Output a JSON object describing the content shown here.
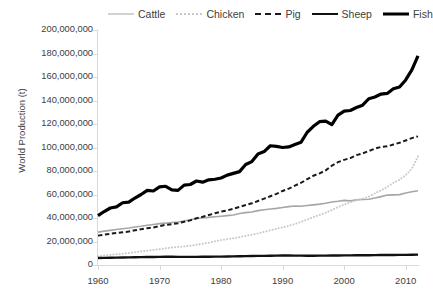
{
  "chart_data": {
    "type": "line",
    "title": "",
    "xlabel": "",
    "ylabel": "World Production (t)",
    "xlim": [
      1960,
      2012
    ],
    "ylim": [
      0,
      200000000
    ],
    "grid": false,
    "legend_position": "top",
    "xticks": [
      "1960",
      "1970",
      "1980",
      "1990",
      "2000",
      "2010"
    ],
    "xtick_values": [
      1960,
      1970,
      1980,
      1990,
      2000,
      2010
    ],
    "yticks": [
      "0",
      "20,000,000",
      "40,000,000",
      "60,000,000",
      "80,000,000",
      "100,000,000",
      "120,000,000",
      "140,000,000",
      "160,000,000",
      "180,000,000",
      "200,000,000"
    ],
    "ytick_values": [
      0,
      20000000,
      40000000,
      60000000,
      80000000,
      100000000,
      120000000,
      140000000,
      160000000,
      180000000,
      200000000
    ],
    "x": [
      1960,
      1961,
      1962,
      1963,
      1964,
      1965,
      1966,
      1967,
      1968,
      1969,
      1970,
      1971,
      1972,
      1973,
      1974,
      1975,
      1976,
      1977,
      1978,
      1979,
      1980,
      1981,
      1982,
      1983,
      1984,
      1985,
      1986,
      1987,
      1988,
      1989,
      1990,
      1991,
      1992,
      1993,
      1994,
      1995,
      1996,
      1997,
      1998,
      1999,
      2000,
      2001,
      2002,
      2003,
      2004,
      2005,
      2006,
      2007,
      2008,
      2009,
      2010,
      2011,
      2012
    ],
    "series": [
      {
        "name": "Cattle",
        "style": "solid",
        "color": "#a6a6a6",
        "width": 1.6,
        "values": [
          28000000,
          28800000,
          29500000,
          30200000,
          30800000,
          31500000,
          32400000,
          33000000,
          33800000,
          34500000,
          35200000,
          35600000,
          36200000,
          36600000,
          37400000,
          38500000,
          39600000,
          40000000,
          40500000,
          41000000,
          41500000,
          42000000,
          42600000,
          43800000,
          44600000,
          45100000,
          46300000,
          47000000,
          47600000,
          48200000,
          49000000,
          49700000,
          50200000,
          50000000,
          50600000,
          51200000,
          51800000,
          52600000,
          53600000,
          54200000,
          55000000,
          54600000,
          55400000,
          55700000,
          56000000,
          57000000,
          58200000,
          59500000,
          59700000,
          59900000,
          61200000,
          62300000,
          63200000
        ]
      },
      {
        "name": "Chicken",
        "style": "dotted",
        "color": "#c9c9c9",
        "width": 2,
        "values": [
          7500000,
          8000000,
          8600000,
          9100000,
          9600000,
          10200000,
          10900000,
          11600000,
          12200000,
          12800000,
          13500000,
          14200000,
          14900000,
          15300000,
          15800000,
          16400000,
          17200000,
          18100000,
          19000000,
          20100000,
          21200000,
          22000000,
          22800000,
          23700000,
          24800000,
          25800000,
          26900000,
          28200000,
          29500000,
          30800000,
          32000000,
          33300000,
          34900000,
          36700000,
          38700000,
          40800000,
          42600000,
          44500000,
          46800000,
          49200000,
          51500000,
          53300000,
          55300000,
          56500000,
          58200000,
          61000000,
          63500000,
          66500000,
          70000000,
          72500000,
          76500000,
          82000000,
          92500000
        ]
      },
      {
        "name": "Pig",
        "style": "dashed",
        "color": "#1a1a1a",
        "width": 2,
        "values": [
          25000000,
          25800000,
          26600000,
          27200000,
          27800000,
          28500000,
          29500000,
          30500000,
          31300000,
          32000000,
          33000000,
          34200000,
          34800000,
          35500000,
          36800000,
          38000000,
          39800000,
          41000000,
          42500000,
          44000000,
          45500000,
          46500000,
          47800000,
          49500000,
          51000000,
          52500000,
          54500000,
          56500000,
          58500000,
          60500000,
          63000000,
          65000000,
          67500000,
          70000000,
          73000000,
          76000000,
          78000000,
          80500000,
          84500000,
          87500000,
          89500000,
          91000000,
          93500000,
          95000000,
          97000000,
          99000000,
          100500000,
          101000000,
          102500000,
          104000000,
          106000000,
          108000000,
          109500000
        ]
      },
      {
        "name": "Sheep",
        "style": "solid",
        "color": "#111111",
        "width": 2.4,
        "values": [
          6000000,
          6100000,
          6200000,
          6300000,
          6400000,
          6500000,
          6600000,
          6700000,
          6750000,
          6800000,
          6900000,
          7000000,
          7000000,
          6950000,
          6900000,
          6900000,
          6950000,
          7000000,
          7050000,
          7100000,
          7150000,
          7250000,
          7350000,
          7450000,
          7550000,
          7650000,
          7750000,
          7800000,
          7900000,
          8000000,
          8100000,
          8050000,
          8000000,
          7950000,
          7900000,
          7900000,
          7950000,
          8000000,
          8050000,
          8100000,
          8150000,
          8200000,
          8250000,
          8300000,
          8350000,
          8400000,
          8450000,
          8500000,
          8550000,
          8600000,
          8650000,
          8750000,
          8850000
        ]
      },
      {
        "name": "Fish",
        "style": "solid",
        "color": "#000000",
        "width": 3.2,
        "values": [
          42000000,
          45500000,
          48500000,
          49500000,
          53000000,
          53500000,
          57000000,
          60000000,
          63500000,
          63000000,
          66500000,
          67000000,
          64000000,
          63500000,
          68000000,
          68500000,
          71500000,
          70500000,
          72500000,
          73000000,
          74000000,
          76500000,
          78000000,
          79500000,
          85500000,
          88000000,
          94500000,
          96500000,
          101500000,
          101000000,
          100000000,
          100500000,
          102500000,
          104500000,
          113000000,
          118000000,
          122000000,
          122500000,
          119500000,
          127500000,
          131000000,
          131500000,
          134000000,
          136000000,
          141500000,
          143000000,
          145500000,
          146000000,
          150000000,
          151500000,
          157500000,
          166000000,
          178000000
        ]
      }
    ]
  },
  "legend": {
    "items": [
      {
        "label": "Cattle",
        "key": "cattle"
      },
      {
        "label": "Chicken",
        "key": "chicken"
      },
      {
        "label": "Pig",
        "key": "pig"
      },
      {
        "label": "Sheep",
        "key": "sheep"
      },
      {
        "label": "Fish",
        "key": "fish"
      }
    ]
  },
  "axes": {
    "y_axis_title": "World Production (t)"
  }
}
